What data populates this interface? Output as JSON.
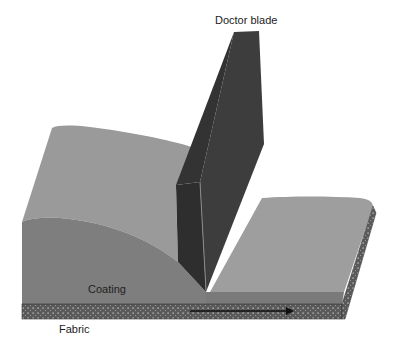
{
  "figure": {
    "labels": {
      "blade": "Doctor blade",
      "coating": "Coating",
      "fabric": "Fabric"
    },
    "arrow": {
      "meaning": "fabric movement direction",
      "direction": "right"
    },
    "colors": {
      "background": "#ffffff",
      "blade_side": "#3c3c3c",
      "blade_front": "#2e2e2e",
      "blade_edge": "#8a8a8a",
      "coating_top": "#9a9a9a",
      "coating_front": "#808080",
      "coating_right_top": "#9c9c9c",
      "coating_thin_front": "#777777",
      "fabric": "#5a5a5a",
      "fabric_dots": "#cfcfcf",
      "arrow": "#111111",
      "text": "#222222"
    }
  }
}
